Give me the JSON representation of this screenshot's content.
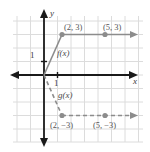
{
  "figure": {
    "kind": "coordinate-grid-graph",
    "background": "#ffffff",
    "grid_color": "#d9d9d9",
    "axis_color": "#1a1a1a",
    "curve_color": "#8c8c8c",
    "point_color": "#8c8c8c",
    "text_color": "#4d4d4d"
  },
  "axes": {
    "x_label": "x",
    "y_label": "y",
    "x_unit_tick_label": "1",
    "y_unit_tick_label": "1",
    "origin_px": [
      44,
      75
    ],
    "grid_spacing_px": 13.5,
    "x_range": [
      -2.4,
      7.6
    ],
    "y_range": [
      -5.4,
      4.4
    ]
  },
  "functions": [
    {
      "name": "f(x)",
      "label": "f(x)",
      "style": "solid",
      "color": "#8c8c8c",
      "description": "rises from origin to (2, 3) then constant ray to the right",
      "vertices": [
        [
          0,
          0
        ],
        [
          2,
          3
        ]
      ],
      "ray_from": [
        2,
        3
      ],
      "ray_direction": "right",
      "points": [
        {
          "x": 2,
          "y": 3,
          "label": "(2, 3)"
        },
        {
          "x": 5,
          "y": 3,
          "label": "(5, 3)"
        }
      ]
    },
    {
      "name": "g(x)",
      "label": "g(x)",
      "style": "dashed",
      "color": "#8c8c8c",
      "description": "falls from origin to (2, -3) then constant ray to the right",
      "vertices": [
        [
          0,
          0
        ],
        [
          2,
          -3
        ]
      ],
      "ray_from": [
        2,
        -3
      ],
      "ray_direction": "right",
      "points": [
        {
          "x": 2,
          "y": -3,
          "label": "(2, −3)"
        },
        {
          "x": 5,
          "y": -3,
          "label": "(5, −3)"
        }
      ]
    }
  ],
  "labels": {
    "f_name": "f(x)",
    "g_name": "g(x)",
    "x_axis": "x",
    "y_axis": "y",
    "x_tick": "1",
    "y_tick": "1",
    "f_point_1": "(2, 3)",
    "f_point_2": "(5, 3)",
    "g_point_1": "(2, −3)",
    "g_point_2": "(5, −3)"
  }
}
